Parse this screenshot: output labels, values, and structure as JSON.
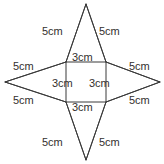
{
  "figure": {
    "stroke_color": "#3a3a3a",
    "fill_color": "#ffffff",
    "text_color": "#33302e",
    "unit": "cm",
    "square_side": "3cm",
    "triangle_side": "5cm",
    "labels": {
      "top_left_slant": "5cm",
      "top_right_slant": "5cm",
      "left_upper_slant": "5cm",
      "right_upper_slant": "5cm",
      "left_lower_slant": "5cm",
      "right_lower_slant": "5cm",
      "bottom_left_slant": "5cm",
      "bottom_right_slant": "5cm",
      "square_top": "3cm",
      "square_middle_left": "3cm",
      "square_middle_right": "3cm",
      "square_bottom": "3cm"
    },
    "geometry": {
      "square": {
        "top_left": [
          66,
          62
        ],
        "top_right": [
          106,
          62
        ],
        "bottom_right": [
          106,
          102
        ],
        "bottom_left": [
          66,
          102
        ]
      },
      "tips": {
        "top": [
          86,
          4
        ],
        "right": [
          160,
          82
        ],
        "bottom": [
          86,
          160
        ],
        "left": [
          5,
          82
        ]
      }
    }
  }
}
